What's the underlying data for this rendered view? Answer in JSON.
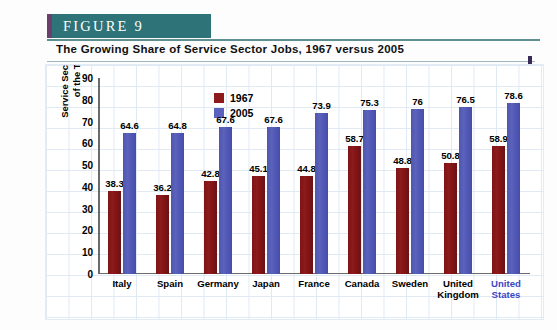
{
  "figure": {
    "banner_label": "FIGURE  9",
    "subtitle": "The Growing Share of Service Sector Jobs, 1967 versus 2005"
  },
  "sources": {
    "text": "SOURCES: Organization for Economic Cooperation and Development, Quarterly Labour Force Statistics, various issues; and Labour Force Statistics, 1985–2005, http://www.sourceoecd.org"
  },
  "colors": {
    "banner_teal": "#2d7377",
    "banner_accent_purple": "#6b3f6e",
    "series_1967": "#8e1a1c",
    "series_2005": "#5a62bd",
    "highlight_label": "#3a49c4",
    "gridline": "#dfeaf5"
  },
  "legend": {
    "entries": [
      {
        "label": "1967",
        "color": "#8e1a1c"
      },
      {
        "label": "2005",
        "color": "#5a62bd"
      }
    ]
  },
  "axes": {
    "y_title_line1": "Service Sector Jobs as a Percent",
    "y_title_line2": "of the Total Labor Force",
    "y_ticks": [
      "90",
      "80",
      "70",
      "60",
      "50",
      "40",
      "30",
      "20",
      "10",
      "0"
    ]
  },
  "chart_data": {
    "type": "bar",
    "title": "The Growing Share of Service Sector Jobs, 1967 versus 2005",
    "xlabel": "",
    "ylabel": "Service Sector Jobs as a Percent of the Total Labor Force",
    "ylim": [
      0,
      90
    ],
    "ytick_step": 10,
    "grid": true,
    "legend_position": "upper-left-inside",
    "categories": [
      "Italy",
      "Spain",
      "Germany",
      "Japan",
      "France",
      "Canada",
      "Sweden",
      "United Kingdom",
      "United States"
    ],
    "highlighted_category": "United States",
    "series": [
      {
        "name": "1967",
        "color": "#8e1a1c",
        "values": [
          38.3,
          36.2,
          42.8,
          45.1,
          44.8,
          58.7,
          48.8,
          50.8,
          58.9
        ],
        "labels": [
          "38.3",
          "36.2",
          "42.8",
          "45.1",
          "44.8",
          "58.7",
          "48.8",
          "50.8",
          "58.9"
        ]
      },
      {
        "name": "2005",
        "color": "#5a62bd",
        "values": [
          64.6,
          64.8,
          67.6,
          67.6,
          73.9,
          75.3,
          76,
          76.5,
          78.6
        ],
        "labels": [
          "64.6",
          "64.8",
          "67.6",
          "67.6",
          "73.9",
          "75.3",
          "76",
          "76.5",
          "78.6"
        ]
      }
    ]
  }
}
